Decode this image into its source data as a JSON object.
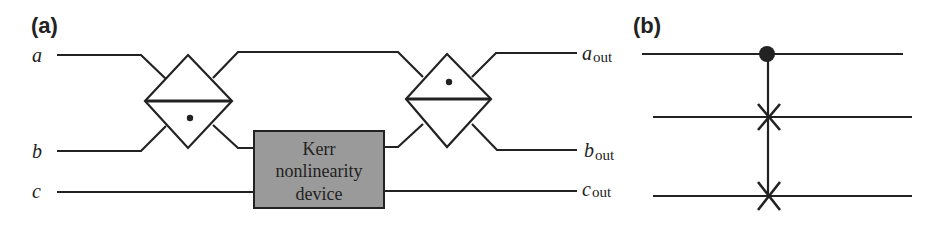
{
  "panel_a": {
    "label": "(a)",
    "inputs": [
      {
        "name": "a"
      },
      {
        "name": "b"
      },
      {
        "name": "c"
      }
    ],
    "outputs": [
      {
        "name": "a",
        "sub": "out"
      },
      {
        "name": "b",
        "sub": "out"
      },
      {
        "name": "c",
        "sub": "out"
      }
    ],
    "device": {
      "lines": [
        "Kerr",
        "nonlinearity",
        "device"
      ],
      "fill": "#9a9a9a"
    },
    "beam_splitters": 2
  },
  "panel_b": {
    "label": "(b)",
    "gate": "controlled-swap (Fredkin)",
    "wires": 3
  },
  "colors": {
    "line": "#222222",
    "background": "#ffffff",
    "device_fill": "#9a9a9a"
  }
}
